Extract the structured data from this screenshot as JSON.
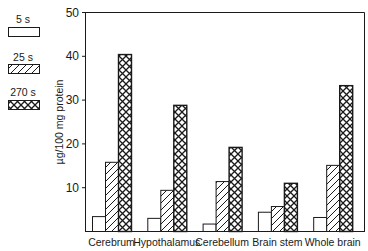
{
  "chart_data": {
    "type": "bar",
    "title": "",
    "xlabel": "",
    "ylabel": "µg/100 mg protein",
    "ylim": [
      0,
      50
    ],
    "yticks": [
      10,
      20,
      30,
      40,
      50
    ],
    "grid": false,
    "legend_position": "left",
    "categories": [
      "Cerebrum",
      "Hypothalamus",
      "Cerebellum",
      "Brain stem",
      "Whole brain"
    ],
    "series": [
      {
        "name": "5 s",
        "pattern": "open",
        "values": [
          3.4,
          3.0,
          1.7,
          4.4,
          3.2
        ]
      },
      {
        "name": "25 s",
        "pattern": "diagonal-hatch",
        "values": [
          15.8,
          9.4,
          11.4,
          5.7,
          15.1
        ]
      },
      {
        "name": "270 s",
        "pattern": "cross-hatch",
        "values": [
          40.4,
          28.8,
          19.2,
          11.0,
          33.3
        ]
      }
    ]
  },
  "colors": {
    "ink": "#1a1a1a",
    "background": "#ffffff"
  }
}
